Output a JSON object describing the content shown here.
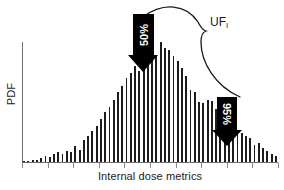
{
  "figure": {
    "background_color": "#ffffff",
    "bar_color": "#1c1c1c",
    "axis_color": "#6e6e6e",
    "arrow_color": "#000000"
  },
  "axes": {
    "ylabel": "PDF",
    "xlabel": "Internal dose metrics"
  },
  "annotations": {
    "arrow_median_label": "50%",
    "arrow_upper_label": "95%",
    "brace_label_main": "UF",
    "brace_label_sub": "I"
  },
  "chart_data": {
    "type": "bar",
    "title": "",
    "xlabel": "Internal dose metrics",
    "ylabel": "PDF",
    "grid": false,
    "legend": "none",
    "xlim": [
      0,
      60
    ],
    "ylim": [
      0,
      100
    ],
    "x_tick_labels": [],
    "y_tick_labels": [],
    "categories": [
      "1",
      "2",
      "3",
      "4",
      "5",
      "6",
      "7",
      "8",
      "9",
      "10",
      "11",
      "12",
      "13",
      "14",
      "15",
      "16",
      "17",
      "18",
      "19",
      "20",
      "21",
      "22",
      "23",
      "24",
      "25",
      "26",
      "27",
      "28",
      "29",
      "30",
      "31",
      "32",
      "33",
      "34",
      "35",
      "36",
      "37",
      "38",
      "39",
      "40",
      "41",
      "42",
      "43",
      "44",
      "45",
      "46",
      "47",
      "48",
      "49",
      "50",
      "51",
      "52",
      "53",
      "54",
      "55",
      "56",
      "57",
      "58",
      "59",
      "60"
    ],
    "values": [
      1,
      1,
      2,
      2,
      3,
      5,
      4,
      7,
      8,
      7,
      9,
      8,
      13,
      10,
      18,
      22,
      26,
      30,
      36,
      42,
      46,
      52,
      58,
      63,
      70,
      74,
      80,
      76,
      86,
      82,
      92,
      88,
      100,
      95,
      93,
      88,
      84,
      78,
      72,
      60,
      58,
      50,
      49,
      52,
      51,
      44,
      40,
      35,
      30,
      28,
      26,
      24,
      22,
      20,
      14,
      16,
      12,
      9,
      7,
      5
    ],
    "markers": [
      {
        "label": "50%",
        "category_index": 32,
        "description": "median arrow at distribution peak"
      },
      {
        "label": "95%",
        "category_index": 52,
        "description": "95th percentile arrow on upper tail"
      }
    ],
    "annotation_brace": {
      "label": "UF_I",
      "from_marker": "50%",
      "to_marker": "95%"
    }
  }
}
